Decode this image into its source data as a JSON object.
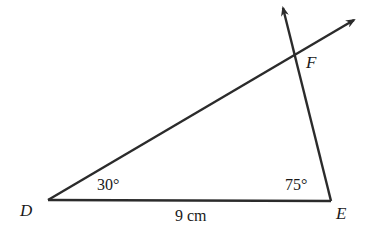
{
  "diagram": {
    "type": "triangle",
    "vertices": {
      "D": {
        "label": "D",
        "x": 48,
        "y": 200
      },
      "E": {
        "label": "E",
        "x": 331,
        "y": 201
      },
      "F": {
        "label": "F",
        "x": 293,
        "y": 55
      }
    },
    "angles": {
      "D": "30°",
      "E": "75°"
    },
    "side_DE": "9 cm",
    "rays": [
      {
        "from": "D",
        "through": "F",
        "arrow_end": {
          "x": 354,
          "y": 20
        }
      },
      {
        "from": "E",
        "through": "F",
        "arrow_end": {
          "x": 283,
          "y": 7
        }
      }
    ],
    "stroke_color": "#2b2b2b"
  }
}
